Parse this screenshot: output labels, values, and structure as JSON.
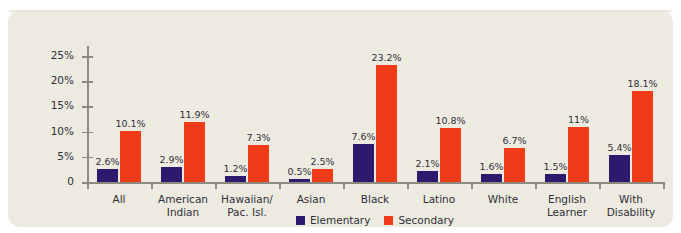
{
  "title_partial": "",
  "chart_data": {
    "type": "bar",
    "title": "",
    "xlabel": "",
    "ylabel": "Percent Suspended in One Year",
    "ylim": [
      0,
      27
    ],
    "grid": false,
    "legend_position": "bottom-center",
    "ytick_labels": [
      "0",
      "5%",
      "10%",
      "15%",
      "20%",
      "25%"
    ],
    "ytick_values": [
      0,
      5,
      10,
      15,
      20,
      25
    ],
    "categories": [
      "All",
      "American Indian",
      "Hawaiian/ Pac. Isl.",
      "Asian",
      "Black",
      "Latino",
      "White",
      "English Learner",
      "With Disability"
    ],
    "category_lines": [
      [
        "All"
      ],
      [
        "American",
        "Indian"
      ],
      [
        "Hawaiian/",
        "Pac. Isl."
      ],
      [
        "Asian"
      ],
      [
        "Black"
      ],
      [
        "Latino"
      ],
      [
        "White"
      ],
      [
        "English",
        "Learner"
      ],
      [
        "With",
        "Disability"
      ]
    ],
    "series": [
      {
        "name": "Elementary",
        "color": "#2b1a6d",
        "values": [
          2.6,
          2.9,
          1.2,
          0.5,
          7.6,
          2.1,
          1.6,
          1.5,
          5.4
        ],
        "labels": [
          "2.6%",
          "2.9%",
          "1.2%",
          "0.5%",
          "7.6%",
          "2.1%",
          "1.6%",
          "1.5%",
          "5.4%"
        ]
      },
      {
        "name": "Secondary",
        "color": "#f03c18",
        "values": [
          10.1,
          11.9,
          7.3,
          2.5,
          23.2,
          10.8,
          6.7,
          11.0,
          18.1
        ],
        "labels": [
          "10.1%",
          "11.9%",
          "7.3%",
          "2.5%",
          "23.2%",
          "10.8%",
          "6.7%",
          "11%",
          "18.1%"
        ]
      }
    ]
  },
  "legend": [
    {
      "label": "Elementary",
      "color": "#2b1a6d"
    },
    {
      "label": "Secondary",
      "color": "#f03c18"
    }
  ],
  "colors": {
    "card_background": "#edeadf",
    "page_background": "#ffffff",
    "axis": "#8d8a80",
    "text": "#2f2f3a",
    "elementary": "#2b1a6d",
    "secondary": "#f03c18"
  }
}
